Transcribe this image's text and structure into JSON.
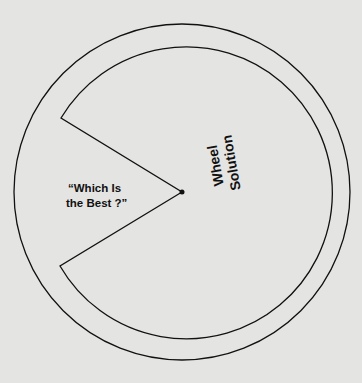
{
  "diagram": {
    "title": "Solution Wheel",
    "wheel_label_line1": "Solution",
    "wheel_label_line2": "Wheel",
    "wedge_label_line1": "“Which Is",
    "wedge_label_line2": "the Best ?”",
    "colors": {
      "background": "#e4e4e2",
      "stroke": "#111111"
    }
  }
}
